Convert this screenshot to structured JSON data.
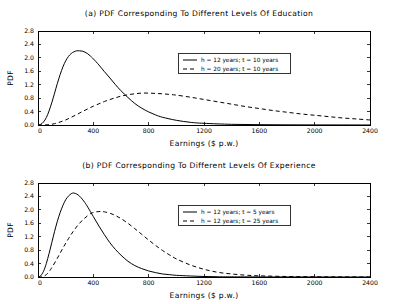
{
  "figure": {
    "background": "#ffffff",
    "ink": "#000000"
  },
  "chart_data": [
    {
      "type": "line",
      "panel_label": "(a)",
      "title": "(a) PDF Corresponding To Different Levels Of Education",
      "xlabel": "Earnings ($ p.w.)",
      "ylabel": "PDF",
      "xlim": [
        0,
        2400
      ],
      "ylim": [
        0.0,
        2.8
      ],
      "xticks": [
        0,
        400,
        800,
        1200,
        1600,
        2000,
        2400
      ],
      "xticklabels": [
        "0",
        "400",
        "800",
        "1200",
        "1600",
        "2000",
        "2400"
      ],
      "yticks": [
        0.0,
        0.4,
        0.8,
        1.2,
        1.6,
        2.0,
        2.4,
        2.8
      ],
      "yticklabels": [
        "0.0",
        "0.4",
        "0.8",
        "1.2",
        "1.6",
        "2.0",
        "2.4",
        "2.8"
      ],
      "grid": false,
      "legend_position": "upper center",
      "series": [
        {
          "name": "h = 12 years; t = 10 years",
          "style": "solid",
          "peak_x": 320,
          "peak_y": 2.21,
          "x": [
            0,
            20,
            40,
            60,
            80,
            100,
            120,
            140,
            160,
            180,
            200,
            220,
            240,
            260,
            280,
            300,
            320,
            340,
            360,
            380,
            400,
            440,
            480,
            520,
            560,
            600,
            650,
            700,
            750,
            800,
            850,
            900,
            1000,
            1100,
            1200,
            1400,
            1600,
            1800,
            2000,
            2200,
            2400
          ],
          "y": [
            0.0,
            0.02,
            0.09,
            0.22,
            0.42,
            0.67,
            0.95,
            1.24,
            1.5,
            1.73,
            1.91,
            2.04,
            2.13,
            2.18,
            2.21,
            2.21,
            2.2,
            2.17,
            2.12,
            2.05,
            1.97,
            1.79,
            1.59,
            1.4,
            1.2,
            1.02,
            0.82,
            0.64,
            0.5,
            0.39,
            0.3,
            0.23,
            0.14,
            0.08,
            0.05,
            0.02,
            0.01,
            0.005,
            0.003,
            0.002,
            0.001
          ]
        },
        {
          "name": "h = 20 years; t = 10 years",
          "style": "dashed",
          "peak_x": 750,
          "peak_y": 0.95,
          "x": [
            0,
            40,
            80,
            120,
            160,
            200,
            240,
            280,
            320,
            360,
            400,
            440,
            480,
            520,
            560,
            600,
            650,
            700,
            750,
            800,
            850,
            900,
            950,
            1000,
            1100,
            1200,
            1300,
            1400,
            1500,
            1600,
            1700,
            1800,
            1900,
            2000,
            2100,
            2200,
            2300,
            2400
          ],
          "y": [
            0.0,
            0.0,
            0.01,
            0.04,
            0.09,
            0.15,
            0.23,
            0.31,
            0.4,
            0.48,
            0.56,
            0.63,
            0.7,
            0.76,
            0.81,
            0.86,
            0.9,
            0.93,
            0.95,
            0.95,
            0.94,
            0.93,
            0.91,
            0.89,
            0.83,
            0.76,
            0.69,
            0.62,
            0.55,
            0.49,
            0.43,
            0.38,
            0.33,
            0.29,
            0.25,
            0.21,
            0.18,
            0.15
          ]
        }
      ]
    },
    {
      "type": "line",
      "panel_label": "(b)",
      "title": "(b) PDF Corresponding To Different Levels Of Experience",
      "xlabel": "Earnings ($ p.w.)",
      "ylabel": "PDF",
      "xlim": [
        0,
        2400
      ],
      "ylim": [
        0.0,
        2.8
      ],
      "xticks": [
        0,
        400,
        800,
        1200,
        1600,
        2000,
        2400
      ],
      "xticklabels": [
        "0",
        "400",
        "800",
        "1200",
        "1600",
        "2000",
        "2400"
      ],
      "yticks": [
        0.0,
        0.4,
        0.8,
        1.2,
        1.6,
        2.0,
        2.4,
        2.8
      ],
      "yticklabels": [
        "0.0",
        "0.4",
        "0.8",
        "1.2",
        "1.6",
        "2.0",
        "2.4",
        "2.8"
      ],
      "grid": false,
      "legend_position": "upper center",
      "series": [
        {
          "name": "h = 12 years; t = 5 years",
          "style": "solid",
          "peak_x": 250,
          "peak_y": 2.5,
          "x": [
            0,
            20,
            40,
            60,
            80,
            100,
            120,
            140,
            160,
            180,
            200,
            220,
            240,
            250,
            260,
            280,
            300,
            320,
            340,
            360,
            400,
            440,
            480,
            520,
            560,
            600,
            650,
            700,
            750,
            800,
            850,
            900,
            950,
            1000,
            1100,
            1200,
            1300,
            1400,
            1600,
            1800,
            2000,
            2200,
            2400
          ],
          "y": [
            0.0,
            0.04,
            0.17,
            0.4,
            0.7,
            1.03,
            1.36,
            1.66,
            1.92,
            2.13,
            2.3,
            2.41,
            2.48,
            2.5,
            2.5,
            2.47,
            2.41,
            2.32,
            2.21,
            2.08,
            1.8,
            1.52,
            1.26,
            1.02,
            0.82,
            0.65,
            0.47,
            0.34,
            0.25,
            0.18,
            0.13,
            0.09,
            0.07,
            0.05,
            0.03,
            0.015,
            0.008,
            0.005,
            0.002,
            0.001,
            0.001,
            0.0,
            0.0
          ]
        },
        {
          "name": "h = 12 years; t = 25 years",
          "style": "dashed",
          "peak_x": 440,
          "peak_y": 1.95,
          "x": [
            0,
            20,
            40,
            60,
            80,
            100,
            140,
            180,
            220,
            260,
            300,
            340,
            380,
            400,
            420,
            440,
            460,
            480,
            520,
            560,
            600,
            650,
            700,
            750,
            800,
            850,
            900,
            950,
            1000,
            1100,
            1200,
            1300,
            1400,
            1500,
            1600,
            1800,
            2000,
            2200,
            2400
          ],
          "y": [
            0.0,
            0.0,
            0.02,
            0.07,
            0.16,
            0.28,
            0.56,
            0.86,
            1.14,
            1.39,
            1.6,
            1.76,
            1.89,
            1.92,
            1.94,
            1.95,
            1.95,
            1.94,
            1.9,
            1.83,
            1.74,
            1.6,
            1.44,
            1.27,
            1.1,
            0.94,
            0.79,
            0.66,
            0.54,
            0.36,
            0.23,
            0.14,
            0.09,
            0.055,
            0.035,
            0.015,
            0.006,
            0.003,
            0.001
          ]
        }
      ]
    }
  ]
}
